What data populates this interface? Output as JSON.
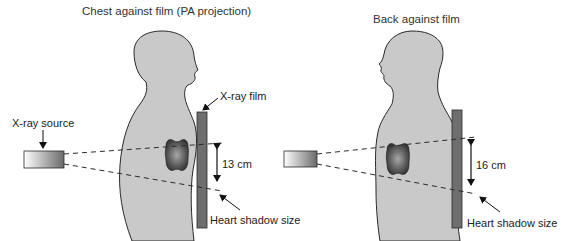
{
  "figure": {
    "panels": [
      {
        "id": "pa",
        "title": "Chest against film (PA projection)",
        "labels": {
          "source": "X-ray source",
          "film": "X-ray film",
          "measurement": "13 cm",
          "shadow": "Heart shadow size"
        }
      },
      {
        "id": "ap",
        "title": "Back against film",
        "labels": {
          "measurement": "16 cm",
          "shadow": "Heart shadow size"
        }
      }
    ],
    "colors": {
      "body_fill": "#c8c8c8",
      "outline": "#2a2a2a",
      "film_fill": "#6e6e6e",
      "heart_dark": "#3a3a3a",
      "heart_light": "#9a9a9a"
    }
  }
}
